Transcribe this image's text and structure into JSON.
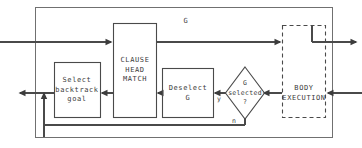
{
  "diagram": {
    "stroke_color": "#4a4a4a",
    "outer_stroke_color": "#707070",
    "background_color": "#ffffff",
    "top_label": "G",
    "nodes": {
      "select_backtrack_goal": {
        "label": "Select\nbacktrack\ngoal",
        "shape": "rect"
      },
      "clause_head_match": {
        "label": "CLAUSE\nHEAD\nMATCH",
        "shape": "rect"
      },
      "deselect_g": {
        "label": "Deselect\nG",
        "shape": "rect"
      },
      "g_selected": {
        "label": "G\nselected\n?",
        "shape": "diamond"
      },
      "body_execution": {
        "label": "BODY\nEXECUTION",
        "shape": "rect-dashed"
      }
    },
    "edge_labels": {
      "yes": "y",
      "no": "n"
    }
  }
}
